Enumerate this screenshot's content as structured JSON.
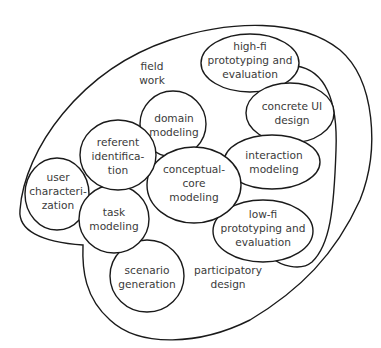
{
  "diagram": {
    "regions": {
      "field_work": {
        "label_line1": "field",
        "label_line2": "work"
      },
      "participatory_design": {
        "label_line1": "participatory",
        "label_line2": "design"
      }
    },
    "nodes": {
      "high_fi": {
        "l1": "high-fi",
        "l2": "prototyping and",
        "l3": "evaluation"
      },
      "concrete_ui": {
        "l1": "concrete UI",
        "l2": "design"
      },
      "interaction": {
        "l1": "interaction",
        "l2": "modeling"
      },
      "low_fi": {
        "l1": "low-fi",
        "l2": "prototyping and",
        "l3": "evaluation"
      },
      "conceptual_core": {
        "l1": "conceptual-",
        "l2": "core",
        "l3": "modeling"
      },
      "domain": {
        "l1": "domain",
        "l2": "modeling"
      },
      "referent": {
        "l1": "referent",
        "l2": "identifica-",
        "l3": "tion"
      },
      "user_char": {
        "l1": "user",
        "l2": "characteri-",
        "l3": "zation"
      },
      "task": {
        "l1": "task",
        "l2": "modeling"
      },
      "scenario": {
        "l1": "scenario",
        "l2": "generation"
      }
    }
  }
}
